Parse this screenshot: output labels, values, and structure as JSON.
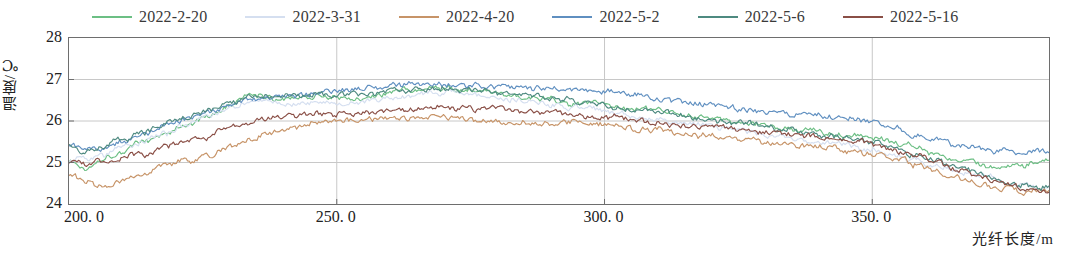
{
  "chart_data": {
    "type": "line",
    "title": "",
    "xlabel": "光纤长度/m",
    "ylabel": "温度/℃",
    "xlim": [
      200.0,
      383.0
    ],
    "ylim": [
      24,
      28
    ],
    "xticks": [
      200.0,
      250.0,
      300.0,
      350.0
    ],
    "xtick_labels": [
      "200. 0",
      "250. 0",
      "300. 0",
      "350. 0"
    ],
    "yticks": [
      24,
      25,
      26,
      27,
      28
    ],
    "ytick_labels": [
      "24",
      "25",
      "26",
      "27",
      "28"
    ],
    "grid": true,
    "grid_axis": "y",
    "legend_position": "top",
    "noise_amplitude": 0.1,
    "series": [
      {
        "name": "2022-2-20",
        "color": "#6cbf84",
        "anchors": [
          [
            200.0,
            25.05
          ],
          [
            203.0,
            24.85
          ],
          [
            206.0,
            25.1
          ],
          [
            210.0,
            25.28
          ],
          [
            214.0,
            25.52
          ],
          [
            218.0,
            25.7
          ],
          [
            222.0,
            25.92
          ],
          [
            226.0,
            26.12
          ],
          [
            230.0,
            26.38
          ],
          [
            234.0,
            26.62
          ],
          [
            238.0,
            26.55
          ],
          [
            242.0,
            26.55
          ],
          [
            246.0,
            26.6
          ],
          [
            250.0,
            26.58
          ],
          [
            254.0,
            26.55
          ],
          [
            258.0,
            26.62
          ],
          [
            262.0,
            26.72
          ],
          [
            266.0,
            26.78
          ],
          [
            270.0,
            26.8
          ],
          [
            274.0,
            26.74
          ],
          [
            278.0,
            26.7
          ],
          [
            282.0,
            26.62
          ],
          [
            286.0,
            26.58
          ],
          [
            290.0,
            26.52
          ],
          [
            294.0,
            26.45
          ],
          [
            298.0,
            26.4
          ],
          [
            302.0,
            26.35
          ],
          [
            306.0,
            26.3
          ],
          [
            310.0,
            26.22
          ],
          [
            314.0,
            26.18
          ],
          [
            318.0,
            26.1
          ],
          [
            322.0,
            26.02
          ],
          [
            326.0,
            25.95
          ],
          [
            330.0,
            25.88
          ],
          [
            334.0,
            25.82
          ],
          [
            338.0,
            25.78
          ],
          [
            342.0,
            25.72
          ],
          [
            346.0,
            25.7
          ],
          [
            350.0,
            25.62
          ],
          [
            354.0,
            25.5
          ],
          [
            358.0,
            25.38
          ],
          [
            362.0,
            25.22
          ],
          [
            366.0,
            25.05
          ],
          [
            370.0,
            24.95
          ],
          [
            374.0,
            24.88
          ],
          [
            378.0,
            24.9
          ],
          [
            383.0,
            25.05
          ]
        ]
      },
      {
        "name": "2022-3-31",
        "color": "#d5dff0",
        "anchors": [
          [
            200.0,
            25.0
          ],
          [
            203.0,
            25.08
          ],
          [
            206.0,
            25.18
          ],
          [
            210.0,
            25.35
          ],
          [
            214.0,
            25.52
          ],
          [
            218.0,
            25.72
          ],
          [
            222.0,
            25.95
          ],
          [
            226.0,
            26.12
          ],
          [
            230.0,
            26.3
          ],
          [
            234.0,
            26.45
          ],
          [
            238.0,
            26.45
          ],
          [
            242.0,
            26.42
          ],
          [
            246.0,
            26.45
          ],
          [
            250.0,
            26.45
          ],
          [
            254.0,
            26.45
          ],
          [
            258.0,
            26.52
          ],
          [
            262.0,
            26.6
          ],
          [
            266.0,
            26.65
          ],
          [
            270.0,
            26.7
          ],
          [
            274.0,
            26.65
          ],
          [
            278.0,
            26.6
          ],
          [
            282.0,
            26.52
          ],
          [
            286.0,
            26.48
          ],
          [
            290.0,
            26.42
          ],
          [
            294.0,
            26.35
          ],
          [
            298.0,
            26.28
          ],
          [
            302.0,
            26.2
          ],
          [
            306.0,
            26.12
          ],
          [
            310.0,
            26.05
          ],
          [
            314.0,
            25.98
          ],
          [
            318.0,
            25.9
          ],
          [
            322.0,
            25.82
          ],
          [
            326.0,
            25.75
          ],
          [
            330.0,
            25.68
          ],
          [
            334.0,
            25.6
          ],
          [
            338.0,
            25.52
          ],
          [
            342.0,
            25.45
          ],
          [
            346.0,
            25.4
          ],
          [
            350.0,
            25.32
          ],
          [
            354.0,
            25.18
          ],
          [
            358.0,
            25.05
          ],
          [
            362.0,
            24.92
          ],
          [
            366.0,
            24.8
          ],
          [
            370.0,
            24.68
          ],
          [
            374.0,
            24.55
          ],
          [
            378.0,
            24.45
          ],
          [
            383.0,
            24.4
          ]
        ]
      },
      {
        "name": "2022-4-20",
        "color": "#c79468",
        "anchors": [
          [
            200.0,
            24.72
          ],
          [
            203.0,
            24.55
          ],
          [
            206.0,
            24.42
          ],
          [
            210.0,
            24.55
          ],
          [
            214.0,
            24.72
          ],
          [
            218.0,
            24.9
          ],
          [
            222.0,
            25.05
          ],
          [
            226.0,
            25.15
          ],
          [
            230.0,
            25.4
          ],
          [
            234.0,
            25.58
          ],
          [
            238.0,
            25.72
          ],
          [
            242.0,
            25.85
          ],
          [
            246.0,
            25.95
          ],
          [
            250.0,
            26.0
          ],
          [
            254.0,
            26.02
          ],
          [
            258.0,
            26.05
          ],
          [
            262.0,
            26.08
          ],
          [
            266.0,
            26.12
          ],
          [
            270.0,
            26.1
          ],
          [
            274.0,
            26.05
          ],
          [
            278.0,
            26.0
          ],
          [
            282.0,
            25.95
          ],
          [
            286.0,
            25.92
          ],
          [
            290.0,
            25.95
          ],
          [
            294.0,
            25.98
          ],
          [
            298.0,
            25.95
          ],
          [
            302.0,
            25.88
          ],
          [
            306.0,
            25.82
          ],
          [
            310.0,
            25.78
          ],
          [
            314.0,
            25.72
          ],
          [
            318.0,
            25.65
          ],
          [
            322.0,
            25.58
          ],
          [
            326.0,
            25.55
          ],
          [
            330.0,
            25.5
          ],
          [
            334.0,
            25.45
          ],
          [
            338.0,
            25.4
          ],
          [
            342.0,
            25.35
          ],
          [
            346.0,
            25.3
          ],
          [
            350.0,
            25.22
          ],
          [
            354.0,
            25.1
          ],
          [
            358.0,
            24.95
          ],
          [
            362.0,
            24.8
          ],
          [
            366.0,
            24.62
          ],
          [
            370.0,
            24.48
          ],
          [
            374.0,
            24.35
          ],
          [
            378.0,
            24.28
          ],
          [
            383.0,
            24.32
          ]
        ]
      },
      {
        "name": "2022-5-2",
        "color": "#5f8fc0",
        "anchors": [
          [
            200.0,
            25.48
          ],
          [
            203.0,
            25.3
          ],
          [
            206.0,
            25.38
          ],
          [
            210.0,
            25.5
          ],
          [
            214.0,
            25.7
          ],
          [
            218.0,
            25.88
          ],
          [
            222.0,
            26.05
          ],
          [
            226.0,
            26.22
          ],
          [
            230.0,
            26.4
          ],
          [
            234.0,
            26.52
          ],
          [
            238.0,
            26.58
          ],
          [
            242.0,
            26.62
          ],
          [
            246.0,
            26.68
          ],
          [
            250.0,
            26.72
          ],
          [
            254.0,
            26.78
          ],
          [
            258.0,
            26.82
          ],
          [
            262.0,
            26.88
          ],
          [
            266.0,
            26.92
          ],
          [
            270.0,
            26.9
          ],
          [
            274.0,
            26.88
          ],
          [
            278.0,
            26.85
          ],
          [
            282.0,
            26.82
          ],
          [
            286.0,
            26.8
          ],
          [
            290.0,
            26.78
          ],
          [
            294.0,
            26.75
          ],
          [
            298.0,
            26.72
          ],
          [
            302.0,
            26.68
          ],
          [
            306.0,
            26.62
          ],
          [
            310.0,
            26.55
          ],
          [
            314.0,
            26.48
          ],
          [
            318.0,
            26.42
          ],
          [
            322.0,
            26.35
          ],
          [
            326.0,
            26.28
          ],
          [
            330.0,
            26.22
          ],
          [
            334.0,
            26.18
          ],
          [
            338.0,
            26.12
          ],
          [
            342.0,
            26.08
          ],
          [
            346.0,
            26.02
          ],
          [
            350.0,
            25.95
          ],
          [
            354.0,
            25.82
          ],
          [
            358.0,
            25.68
          ],
          [
            362.0,
            25.55
          ],
          [
            366.0,
            25.42
          ],
          [
            370.0,
            25.35
          ],
          [
            374.0,
            25.28
          ],
          [
            378.0,
            25.22
          ],
          [
            383.0,
            25.3
          ]
        ]
      },
      {
        "name": "2022-5-6",
        "color": "#4e8a80",
        "anchors": [
          [
            200.0,
            25.4
          ],
          [
            203.0,
            25.25
          ],
          [
            206.0,
            25.35
          ],
          [
            210.0,
            25.52
          ],
          [
            214.0,
            25.72
          ],
          [
            218.0,
            25.92
          ],
          [
            222.0,
            26.1
          ],
          [
            226.0,
            26.28
          ],
          [
            230.0,
            26.45
          ],
          [
            234.0,
            26.62
          ],
          [
            238.0,
            26.62
          ],
          [
            242.0,
            26.6
          ],
          [
            246.0,
            26.62
          ],
          [
            250.0,
            26.6
          ],
          [
            254.0,
            26.62
          ],
          [
            258.0,
            26.68
          ],
          [
            262.0,
            26.75
          ],
          [
            266.0,
            26.8
          ],
          [
            270.0,
            26.8
          ],
          [
            274.0,
            26.76
          ],
          [
            278.0,
            26.72
          ],
          [
            282.0,
            26.68
          ],
          [
            286.0,
            26.62
          ],
          [
            290.0,
            26.55
          ],
          [
            294.0,
            26.48
          ],
          [
            298.0,
            26.42
          ],
          [
            302.0,
            26.35
          ],
          [
            306.0,
            26.28
          ],
          [
            310.0,
            26.2
          ],
          [
            314.0,
            26.12
          ],
          [
            318.0,
            26.05
          ],
          [
            322.0,
            25.98
          ],
          [
            326.0,
            25.92
          ],
          [
            330.0,
            25.85
          ],
          [
            334.0,
            25.78
          ],
          [
            338.0,
            25.72
          ],
          [
            342.0,
            25.65
          ],
          [
            346.0,
            25.58
          ],
          [
            350.0,
            25.48
          ],
          [
            354.0,
            25.35
          ],
          [
            358.0,
            25.2
          ],
          [
            362.0,
            25.05
          ],
          [
            366.0,
            24.9
          ],
          [
            370.0,
            24.75
          ],
          [
            374.0,
            24.6
          ],
          [
            378.0,
            24.48
          ],
          [
            383.0,
            24.42
          ]
        ]
      },
      {
        "name": "2022-5-16",
        "color": "#8a4f46",
        "anchors": [
          [
            200.0,
            25.05
          ],
          [
            203.0,
            24.95
          ],
          [
            206.0,
            25.05
          ],
          [
            210.0,
            25.12
          ],
          [
            214.0,
            25.22
          ],
          [
            218.0,
            25.38
          ],
          [
            222.0,
            25.52
          ],
          [
            226.0,
            25.6
          ],
          [
            230.0,
            25.85
          ],
          [
            234.0,
            26.0
          ],
          [
            238.0,
            26.12
          ],
          [
            242.0,
            26.15
          ],
          [
            246.0,
            26.18
          ],
          [
            250.0,
            26.18
          ],
          [
            254.0,
            26.2
          ],
          [
            258.0,
            26.22
          ],
          [
            262.0,
            26.28
          ],
          [
            266.0,
            26.32
          ],
          [
            270.0,
            26.35
          ],
          [
            274.0,
            26.32
          ],
          [
            278.0,
            26.3
          ],
          [
            282.0,
            26.28
          ],
          [
            286.0,
            26.25
          ],
          [
            290.0,
            26.22
          ],
          [
            294.0,
            26.18
          ],
          [
            298.0,
            26.12
          ],
          [
            302.0,
            26.08
          ],
          [
            306.0,
            26.02
          ],
          [
            310.0,
            25.98
          ],
          [
            314.0,
            25.92
          ],
          [
            318.0,
            25.88
          ],
          [
            322.0,
            25.82
          ],
          [
            326.0,
            25.78
          ],
          [
            330.0,
            25.72
          ],
          [
            334.0,
            25.68
          ],
          [
            338.0,
            25.62
          ],
          [
            342.0,
            25.58
          ],
          [
            346.0,
            25.52
          ],
          [
            350.0,
            25.45
          ],
          [
            354.0,
            25.32
          ],
          [
            358.0,
            25.18
          ],
          [
            362.0,
            25.02
          ],
          [
            366.0,
            24.85
          ],
          [
            370.0,
            24.68
          ],
          [
            374.0,
            24.52
          ],
          [
            378.0,
            24.4
          ],
          [
            383.0,
            24.35
          ]
        ]
      }
    ]
  },
  "legend": {
    "items": [
      {
        "label": "2022-2-20",
        "color": "#6cbf84"
      },
      {
        "label": "2022-3-31",
        "color": "#d5dff0"
      },
      {
        "label": "2022-4-20",
        "color": "#c79468"
      },
      {
        "label": "2022-5-2",
        "color": "#5f8fc0"
      },
      {
        "label": "2022-5-6",
        "color": "#4e8a80"
      },
      {
        "label": "2022-5-16",
        "color": "#8a4f46"
      }
    ]
  },
  "axes": {
    "y_title": "温度/℃",
    "x_title": "光纤长度/m",
    "y_labels": [
      "28",
      "27",
      "26",
      "25",
      "24"
    ],
    "x_labels": [
      "200. 0",
      "250. 0",
      "300. 0",
      "350. 0"
    ]
  },
  "colors": {
    "axis": "#6e6e6e",
    "grid": "#c8c8c8",
    "text": "#222222",
    "background": "#ffffff"
  }
}
